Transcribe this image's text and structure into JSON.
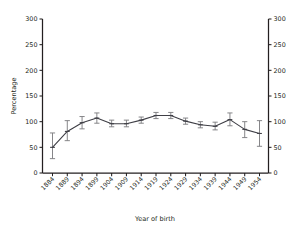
{
  "chart_data": {
    "type": "line",
    "title": "",
    "xlabel": "Year of birth",
    "ylabel": "Percentage",
    "ylabel_right": "Percentage",
    "categories": [
      "1884",
      "1889",
      "1894",
      "1899",
      "1904",
      "1909",
      "1914",
      "1919",
      "1924",
      "1929",
      "1934",
      "1939",
      "1944",
      "1949",
      "1954"
    ],
    "values": [
      50,
      81,
      98,
      107,
      96,
      96,
      103,
      112,
      112,
      101,
      94,
      91,
      104,
      85,
      77
    ],
    "error_low": [
      28,
      63,
      86,
      97,
      90,
      90,
      97,
      106,
      106,
      95,
      88,
      84,
      92,
      69,
      52
    ],
    "error_high": [
      78,
      102,
      110,
      117,
      103,
      103,
      109,
      118,
      118,
      107,
      100,
      99,
      117,
      100,
      102
    ],
    "ylim": [
      0,
      300
    ],
    "yticks": [
      0,
      50,
      100,
      150,
      200,
      250,
      300
    ],
    "ytick_labels": [
      "0",
      "50",
      "100",
      "150",
      "200",
      "250",
      "300"
    ],
    "ytick_labels_right": [
      "0",
      "50",
      "100",
      "150",
      "200",
      "250",
      "300"
    ],
    "grid": false,
    "legend": false,
    "error_bars": true,
    "xtick_rotation": 45,
    "line_color": "#3f3f46",
    "error_color": "#808083",
    "axis_color": "#231f20",
    "background_color": "#ffffff"
  }
}
